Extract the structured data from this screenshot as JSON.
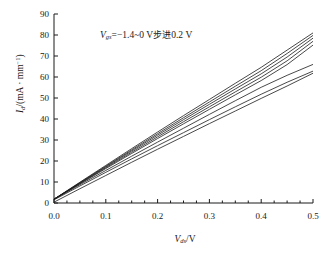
{
  "chart_data": {
    "type": "line",
    "title": "",
    "subtitle": "",
    "annotation": "Vgs=−1.4~0 V步进0.2 V",
    "annotation_parts": {
      "symbol": "V",
      "symbol_sub": "gs",
      "equals": "=−1.4~0 V",
      "cn_step": "步进",
      "step_value": "0.2 V"
    },
    "xlabel": "Vds/V",
    "xlabel_parts": {
      "symbol": "V",
      "symbol_sub": "ds",
      "unit": "/V"
    },
    "ylabel": "Id/(mA·mm⁻¹)",
    "ylabel_parts": {
      "symbol": "I",
      "symbol_sub": "d",
      "unit_open": "/(mA · mm",
      "unit_exp": "−1",
      "unit_close": ")"
    },
    "xlim": [
      0.0,
      0.5
    ],
    "ylim": [
      0,
      90
    ],
    "xticks": [
      "0.0",
      "0.1",
      "0.2",
      "0.3",
      "0.4",
      "0.5"
    ],
    "xtick_values": [
      0.0,
      0.1,
      0.2,
      0.3,
      0.4,
      0.5
    ],
    "yticks": [
      "0",
      "10",
      "20",
      "30",
      "40",
      "50",
      "60",
      "70",
      "80",
      "90"
    ],
    "ytick_values": [
      0,
      10,
      20,
      30,
      40,
      50,
      60,
      70,
      80,
      90
    ],
    "grid": false,
    "legend": "none",
    "line_color": "#1a1a1a",
    "series": [
      {
        "name": "Vgs = 0 V",
        "x": [
          0.0,
          0.05,
          0.1,
          0.15,
          0.2,
          0.25,
          0.3,
          0.35,
          0.4,
          0.45,
          0.5
        ],
        "values": [
          1.8,
          9.9,
          17.9,
          25.9,
          33.8,
          41.6,
          49.3,
          57.0,
          64.6,
          72.8,
          81.0
        ]
      },
      {
        "name": "Vgs = -0.2 V",
        "x": [
          0.0,
          0.05,
          0.1,
          0.15,
          0.2,
          0.25,
          0.3,
          0.35,
          0.4,
          0.45,
          0.5
        ],
        "values": [
          1.8,
          9.7,
          17.5,
          25.3,
          33.0,
          40.6,
          48.1,
          55.6,
          63.0,
          71.2,
          79.8
        ]
      },
      {
        "name": "Vgs = -0.4 V",
        "x": [
          0.0,
          0.05,
          0.1,
          0.15,
          0.2,
          0.25,
          0.3,
          0.35,
          0.4,
          0.45,
          0.5
        ],
        "values": [
          1.8,
          9.5,
          17.2,
          24.8,
          32.3,
          39.7,
          47.0,
          54.3,
          61.5,
          69.5,
          78.5
        ]
      },
      {
        "name": "Vgs = -0.6 V",
        "x": [
          0.0,
          0.05,
          0.1,
          0.15,
          0.2,
          0.25,
          0.3,
          0.35,
          0.4,
          0.45,
          0.5
        ],
        "values": [
          1.8,
          9.3,
          16.8,
          24.2,
          31.5,
          38.7,
          45.8,
          52.9,
          59.9,
          67.7,
          77.0
        ]
      },
      {
        "name": "Vgs = -0.8 V",
        "x": [
          0.0,
          0.05,
          0.1,
          0.15,
          0.2,
          0.25,
          0.3,
          0.35,
          0.4,
          0.45,
          0.5
        ],
        "values": [
          1.8,
          9.1,
          16.4,
          23.6,
          30.7,
          37.7,
          44.6,
          51.5,
          58.3,
          65.9,
          75.2
        ]
      },
      {
        "name": "Vgs = -1.0 V",
        "x": [
          0.0,
          0.05,
          0.1,
          0.15,
          0.2,
          0.25,
          0.3,
          0.35,
          0.4,
          0.45,
          0.5
        ],
        "values": [
          1.8,
          8.7,
          15.5,
          22.3,
          29.0,
          35.6,
          42.2,
          48.7,
          55.1,
          60.8,
          66.0
        ]
      },
      {
        "name": "Vgs = -1.2 V",
        "x": [
          0.0,
          0.05,
          0.1,
          0.15,
          0.2,
          0.25,
          0.3,
          0.35,
          0.4,
          0.45,
          0.5
        ],
        "values": [
          1.5,
          8.1,
          14.6,
          21.0,
          27.3,
          33.5,
          39.7,
          45.8,
          51.8,
          57.5,
          62.8
        ]
      },
      {
        "name": "Vgs = -1.4 V",
        "x": [
          0.0,
          0.05,
          0.1,
          0.15,
          0.2,
          0.25,
          0.3,
          0.35,
          0.4,
          0.45,
          0.5
        ],
        "values": [
          0.4,
          6.8,
          13.1,
          19.4,
          25.6,
          31.7,
          37.8,
          43.8,
          49.8,
          55.7,
          61.8
        ]
      }
    ]
  }
}
